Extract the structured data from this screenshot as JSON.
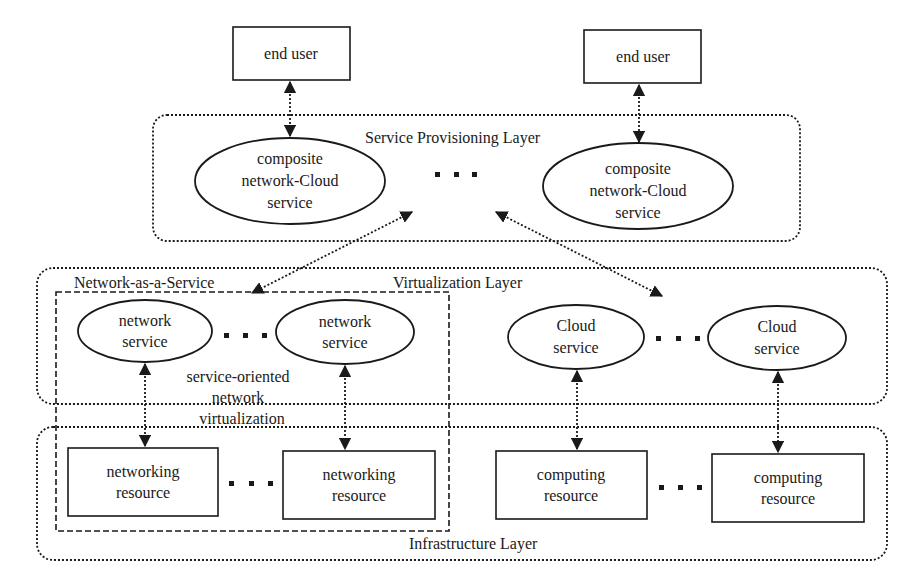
{
  "diagram": {
    "end_users": [
      {
        "label": "end user"
      },
      {
        "label": "end user"
      }
    ],
    "layers": {
      "service_provisioning": {
        "label": "Service Provisioning Layer"
      },
      "virtualization": {
        "label": "Virtualization Layer"
      },
      "infrastructure": {
        "label": "Infrastructure Layer"
      }
    },
    "composite_services": [
      {
        "line1": "composite",
        "line2": "network-Cloud",
        "line3": "service"
      },
      {
        "line1": "composite",
        "line2": "network-Cloud",
        "line3": "service"
      }
    ],
    "naas": {
      "label": "Network-as-a-Service",
      "description_line1": "service-oriented",
      "description_line2": "network",
      "description_line3": "virtualization"
    },
    "network_services": [
      {
        "line1": "network",
        "line2": "service"
      },
      {
        "line1": "network",
        "line2": "service"
      }
    ],
    "cloud_services": [
      {
        "line1": "Cloud",
        "line2": "service"
      },
      {
        "line1": "Cloud",
        "line2": "service"
      }
    ],
    "networking_resources": [
      {
        "line1": "networking",
        "line2": "resource"
      },
      {
        "line1": "networking",
        "line2": "resource"
      }
    ],
    "computing_resources": [
      {
        "line1": "computing",
        "line2": "resource"
      },
      {
        "line1": "computing",
        "line2": "resource"
      }
    ],
    "ellipsis_symbol": "...",
    "colors": {
      "stroke": "#1a1a1a",
      "background": "#ffffff"
    }
  }
}
